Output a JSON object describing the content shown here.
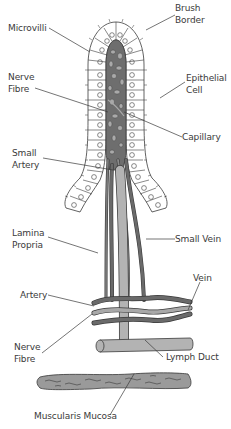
{
  "diagram": {
    "colors": {
      "outline": "#3a3a3a",
      "core_fill": "#6e6e6e",
      "core_spots": "#a9a9a9",
      "vessel_dark": "#6a6a6a",
      "vessel_light": "#a8a8a8",
      "lymph": "#b3b3b3",
      "muscularis": "#9a9a9a",
      "label_text": "#3a3a3a"
    },
    "labels": {
      "brush_border": "Brush\nBorder",
      "microvilli": "Microvilli",
      "nerve_fibre_top": "Nerve\nFibre",
      "epithelial_cell": "Epithelial\nCell",
      "capillary": "Capillary",
      "small_artery": "Small\nArtery",
      "lamina_propria": "Lamina\nPropria",
      "small_vein": "Small Vein",
      "vein": "Vein",
      "artery": "Artery",
      "nerve_fibre_bottom": "Nerve\nFibre",
      "lymph_duct": "Lymph Duct",
      "muscularis_mucosa": "Muscularis Mucosa"
    }
  }
}
